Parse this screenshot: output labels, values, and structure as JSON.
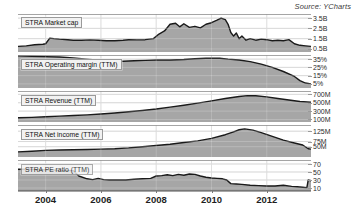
{
  "source": {
    "label": "Source: YCharts"
  },
  "axis": {
    "x_ticks": [
      "2004",
      "2006",
      "2008",
      "2010",
      "2012"
    ]
  },
  "chart_data": {
    "type": "area",
    "title": "",
    "subtitle": "",
    "xlabel": "",
    "ylabel": "",
    "grid": true,
    "legend_position": "inline-left",
    "attribution": "Source: YCharts",
    "x_axis": {
      "tick_labels": [
        "2004",
        "2006",
        "2008",
        "2010",
        "2012"
      ],
      "range": [
        "2003.0",
        "2013.6"
      ]
    },
    "panels": [
      {
        "name": "market-cap",
        "label": "STRA Market cap",
        "ylabel": "",
        "y_ticks": [
          "3.5B",
          "2.5B",
          "1.5B",
          "0.5B"
        ],
        "y_tick_values": [
          3.5,
          2.5,
          1.5,
          0.5
        ],
        "ylim": [
          0.2,
          3.9
        ],
        "x": [
          2003.0,
          2003.3,
          2003.6,
          2003.9,
          2004.0,
          2004.15,
          2004.3,
          2004.5,
          2004.8,
          2005.0,
          2005.3,
          2005.6,
          2005.9,
          2006.2,
          2006.5,
          2006.8,
          2007.0,
          2007.3,
          2007.6,
          2007.9,
          2008.1,
          2008.3,
          2008.5,
          2008.7,
          2008.85,
          2009.0,
          2009.2,
          2009.4,
          2009.6,
          2009.8,
          2010.0,
          2010.2,
          2010.35,
          2010.5,
          2010.6,
          2010.7,
          2010.8,
          2010.9,
          2011.0,
          2011.1,
          2011.25,
          2011.4,
          2011.6,
          2011.8,
          2012.0,
          2012.2,
          2012.4,
          2012.6,
          2012.8,
          2013.0,
          2013.2,
          2013.4,
          2013.6
        ],
        "values": [
          0.75,
          0.8,
          0.9,
          0.95,
          1.0,
          1.55,
          1.5,
          1.45,
          1.4,
          1.35,
          1.35,
          1.38,
          1.35,
          1.3,
          1.3,
          1.35,
          1.4,
          1.38,
          1.4,
          1.5,
          1.95,
          2.25,
          2.9,
          3.0,
          2.65,
          2.95,
          2.6,
          2.7,
          2.55,
          2.9,
          3.05,
          3.3,
          3.5,
          3.35,
          2.9,
          2.1,
          1.75,
          2.05,
          1.5,
          1.75,
          1.35,
          1.5,
          1.35,
          1.45,
          1.4,
          1.3,
          1.35,
          1.3,
          1.4,
          1.0,
          0.85,
          0.8,
          0.75
        ]
      },
      {
        "name": "operating-margin",
        "label": "STRA Operating margin (TTM)",
        "ylabel": "",
        "y_ticks": [
          "35%",
          "25%",
          "15%",
          "5%"
        ],
        "y_tick_values": [
          35,
          25,
          15,
          5
        ],
        "ylim": [
          0,
          40
        ],
        "x": [
          2003.0,
          2003.5,
          2004.0,
          2004.5,
          2005.0,
          2005.5,
          2006.0,
          2006.4,
          2006.8,
          2007.2,
          2007.6,
          2008.0,
          2008.5,
          2009.0,
          2009.4,
          2009.8,
          2010.0,
          2010.3,
          2010.6,
          2011.0,
          2011.4,
          2011.8,
          2012.2,
          2012.6,
          2013.0,
          2013.2,
          2013.4,
          2013.6
        ],
        "values": [
          39,
          38.5,
          38,
          37.5,
          36.5,
          35,
          33.5,
          32.5,
          32.5,
          33,
          33.5,
          34,
          34,
          34.5,
          35.5,
          36,
          36.2,
          36,
          35,
          34,
          32,
          29,
          25,
          20,
          14,
          9,
          6,
          5
        ]
      },
      {
        "name": "revenue",
        "label": "STRA Revenue (TTM)",
        "ylabel": "",
        "y_ticks": [
          "700M",
          "500M",
          "300M",
          "100M"
        ],
        "y_tick_values": [
          700,
          500,
          300,
          100
        ],
        "ylim": [
          40,
          780
        ],
        "x": [
          2003.0,
          2003.5,
          2004.0,
          2004.5,
          2005.0,
          2005.5,
          2006.0,
          2006.5,
          2007.0,
          2007.5,
          2008.0,
          2008.5,
          2009.0,
          2009.5,
          2010.0,
          2010.5,
          2011.0,
          2011.3,
          2011.6,
          2012.0,
          2012.4,
          2012.8,
          2013.2,
          2013.6
        ],
        "values": [
          140,
          150,
          165,
          180,
          195,
          210,
          230,
          255,
          285,
          315,
          350,
          395,
          440,
          490,
          545,
          600,
          650,
          670,
          665,
          640,
          600,
          565,
          530,
          510
        ]
      },
      {
        "name": "net-income",
        "label": "STRA Net income (TTM)",
        "ylabel": "",
        "y_ticks": [
          "125M",
          "75M",
          "50M"
        ],
        "y_tick_values": [
          125,
          75,
          50
        ],
        "ylim": [
          0,
          155
        ],
        "x": [
          2003.0,
          2003.5,
          2004.0,
          2004.5,
          2005.0,
          2005.5,
          2006.0,
          2006.5,
          2007.0,
          2007.5,
          2008.0,
          2008.5,
          2009.0,
          2009.5,
          2010.0,
          2010.5,
          2010.8,
          2011.0,
          2011.2,
          2011.5,
          2011.8,
          2012.2,
          2012.6,
          2013.0,
          2013.3,
          2013.5,
          2013.6
        ],
        "values": [
          25,
          28,
          32,
          34,
          35,
          36,
          38,
          40,
          44,
          50,
          56,
          62,
          70,
          78,
          90,
          108,
          122,
          132,
          136,
          130,
          118,
          100,
          82,
          68,
          58,
          40,
          38
        ]
      },
      {
        "name": "pe-ratio",
        "label": "STRA PE ratio (TTM)",
        "ylabel": "",
        "y_ticks": [
          "70",
          "50",
          "30",
          "10"
        ],
        "y_tick_values": [
          70,
          50,
          30,
          10
        ],
        "ylim": [
          0,
          80
        ],
        "x": [
          2003.0,
          2003.4,
          2003.8,
          2004.2,
          2004.6,
          2005.0,
          2005.2,
          2005.5,
          2005.7,
          2005.9,
          2006.1,
          2006.3,
          2006.6,
          2006.9,
          2007.2,
          2007.5,
          2007.8,
          2008.0,
          2008.2,
          2008.4,
          2008.6,
          2008.8,
          2009.0,
          2009.2,
          2009.4,
          2009.6,
          2009.8,
          2010.0,
          2010.2,
          2010.4,
          2010.55,
          2010.7,
          2010.9,
          2011.1,
          2011.4,
          2011.7,
          2012.0,
          2012.3,
          2012.6,
          2012.9,
          2013.1,
          2013.3,
          2013.45,
          2013.5,
          2013.6
        ],
        "values": [
          57,
          57,
          56,
          55,
          54,
          53,
          40,
          33,
          31,
          34,
          31,
          30,
          30,
          30,
          32,
          33,
          34,
          40,
          41,
          43,
          41,
          44,
          42,
          45,
          44,
          40,
          37,
          35,
          34,
          33,
          30,
          21,
          20,
          19,
          17,
          16,
          15,
          15,
          17,
          14,
          13,
          12,
          11,
          30,
          28
        ]
      }
    ]
  }
}
